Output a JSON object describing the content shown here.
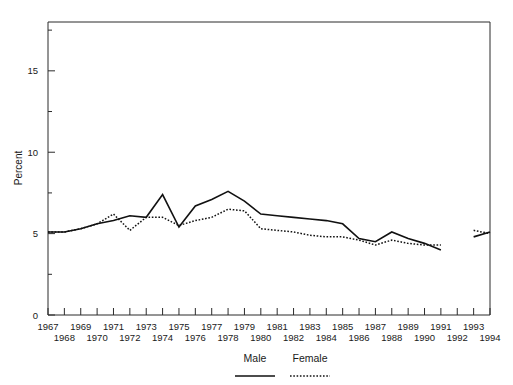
{
  "chart_data": {
    "type": "line",
    "title": "",
    "xlabel": "",
    "ylabel": "Percent",
    "ylim": [
      0,
      18
    ],
    "xlim": [
      1967,
      1994
    ],
    "yticks": [
      0,
      5,
      10,
      15
    ],
    "ytick_labels": [
      "0",
      "5",
      "10",
      "15"
    ],
    "y_minor_ticks": [
      2.5,
      7.5,
      12.5,
      17.5
    ],
    "grid": false,
    "legend_position": "bottom",
    "x": [
      1967,
      1968,
      1969,
      1970,
      1971,
      1972,
      1973,
      1974,
      1975,
      1976,
      1977,
      1978,
      1979,
      1980,
      1981,
      1982,
      1983,
      1984,
      1985,
      1986,
      1987,
      1988,
      1989,
      1990,
      1991,
      1992,
      1993,
      1994
    ],
    "xtick_labels_top": [
      "1967",
      "1969",
      "1971",
      "1973",
      "1975",
      "1977",
      "1979",
      "1981",
      "1983",
      "1985",
      "1987",
      "1989",
      "1991",
      "1993"
    ],
    "xtick_labels_bottom": [
      "1968",
      "1970",
      "1972",
      "1974",
      "1976",
      "1978",
      "1980",
      "1982",
      "1984",
      "1986",
      "1988",
      "1990",
      "1992",
      "1994"
    ],
    "series": [
      {
        "name": "Male",
        "style": "solid",
        "color": "#111111",
        "values": [
          5.1,
          5.1,
          5.3,
          5.6,
          5.8,
          6.1,
          6.0,
          7.4,
          5.4,
          6.7,
          7.1,
          7.6,
          7.0,
          6.2,
          6.1,
          6.0,
          5.9,
          5.8,
          5.6,
          4.7,
          4.5,
          5.1,
          4.7,
          4.4,
          4.0,
          null,
          4.8,
          5.1
        ]
      },
      {
        "name": "Female",
        "style": "dotted",
        "color": "#111111",
        "values": [
          5.1,
          5.1,
          5.3,
          5.6,
          6.2,
          5.2,
          6.0,
          6.0,
          5.5,
          5.8,
          6.0,
          6.5,
          6.4,
          5.3,
          5.2,
          5.1,
          4.9,
          4.8,
          4.8,
          4.6,
          4.3,
          4.6,
          4.4,
          4.3,
          4.3,
          null,
          5.2,
          5.0
        ]
      }
    ]
  },
  "legend": {
    "items": [
      {
        "label": "Male",
        "style": "solid"
      },
      {
        "label": "Female",
        "style": "dotted"
      }
    ]
  },
  "axes": {
    "y_axis_title": "Percent"
  }
}
